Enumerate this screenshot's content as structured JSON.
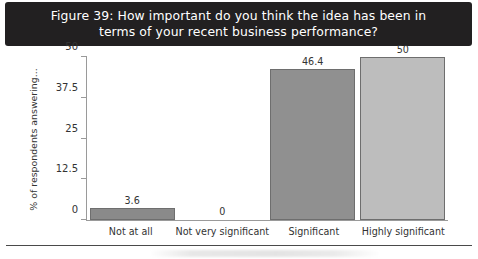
{
  "figure": {
    "title": "Figure 39: How important do you think the idea has been in terms of your recent business performance?"
  },
  "chart_data": {
    "type": "bar",
    "title": "Figure 39: How important do you think the idea has been in terms of your recent business performance?",
    "categories": [
      "Not at all",
      "Not very significant",
      "Significant",
      "Highly significant"
    ],
    "values": [
      3.6,
      0,
      46.4,
      50
    ],
    "value_labels": [
      "3.6",
      "0",
      "46.4",
      "50"
    ],
    "bar_colors": [
      "#8a8a8a",
      "#ffffff",
      "#909090",
      "#bdbdbd"
    ],
    "bar_border_color": "#6e6e6e",
    "xlabel": "",
    "ylabel": "% of respondents answering...",
    "ylim": [
      0,
      50
    ],
    "yticks": [
      0,
      12.5,
      25,
      37.5,
      50
    ],
    "ytick_labels": [
      "0",
      "12.5",
      "25",
      "37.5",
      "50"
    ],
    "grid": false,
    "legend": false
  },
  "style": {
    "banner_bg": "#222021",
    "banner_text": "#ffffff",
    "axis_color": "#9a9a9a"
  }
}
